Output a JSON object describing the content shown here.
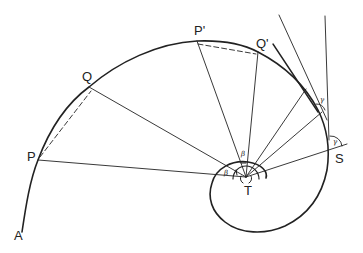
{
  "diagram": {
    "type": "equiangular-spiral-construction",
    "points": {
      "A": "A",
      "P": "P",
      "Q": "Q",
      "P_prime": "P'",
      "Q_prime": "Q'",
      "S": "S",
      "T": "T"
    },
    "angles": {
      "beta_1": "β",
      "beta_2": "β",
      "gamma_1": "γ",
      "gamma_2": "γ"
    },
    "colors": {
      "stroke": "#222222",
      "background": "#ffffff"
    }
  }
}
